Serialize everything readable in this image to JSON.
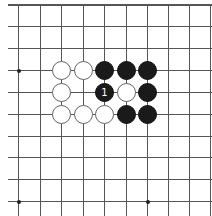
{
  "board": {
    "description": "Go problem diagram, top-left corner region with top edge",
    "columns_x": [
      18,
      40,
      61,
      83,
      104,
      126,
      147,
      168,
      189,
      210
    ],
    "rows_y": [
      4,
      26,
      48,
      70,
      92,
      114,
      136,
      157,
      179,
      201
    ],
    "line_color": "#555555",
    "background": "#ffffff",
    "star_points": [
      {
        "col": 0,
        "row": 3
      },
      {
        "col": 0,
        "row": 9
      },
      {
        "col": 6,
        "row": 9
      }
    ],
    "stones": [
      {
        "col": 2,
        "row": 3,
        "color": "white",
        "label": ""
      },
      {
        "col": 3,
        "row": 3,
        "color": "white",
        "label": ""
      },
      {
        "col": 4,
        "row": 3,
        "color": "black",
        "label": ""
      },
      {
        "col": 5,
        "row": 3,
        "color": "black",
        "label": ""
      },
      {
        "col": 6,
        "row": 3,
        "color": "black",
        "label": ""
      },
      {
        "col": 2,
        "row": 4,
        "color": "white",
        "label": ""
      },
      {
        "col": 4,
        "row": 4,
        "color": "black",
        "label": "1"
      },
      {
        "col": 5,
        "row": 4,
        "color": "white",
        "label": ""
      },
      {
        "col": 6,
        "row": 4,
        "color": "black",
        "label": ""
      },
      {
        "col": 2,
        "row": 5,
        "color": "white",
        "label": ""
      },
      {
        "col": 3,
        "row": 5,
        "color": "white",
        "label": ""
      },
      {
        "col": 4,
        "row": 5,
        "color": "white",
        "label": ""
      },
      {
        "col": 5,
        "row": 5,
        "color": "black",
        "label": ""
      },
      {
        "col": 6,
        "row": 5,
        "color": "black",
        "label": ""
      }
    ]
  }
}
